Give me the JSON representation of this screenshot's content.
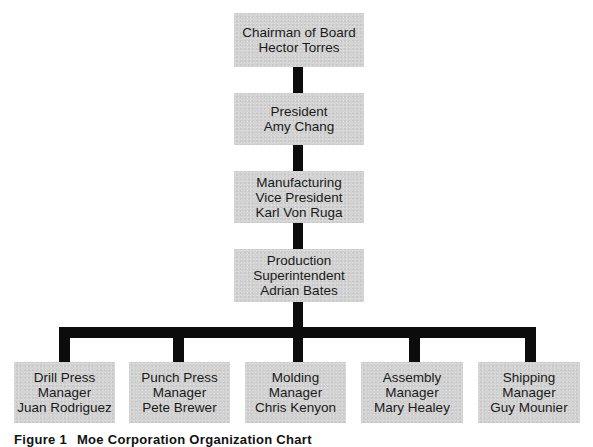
{
  "chart": {
    "title": "Organization Chart",
    "levels": [
      {
        "id": "chairman",
        "lines": [
          "Chairman of Board",
          "Hector Torres"
        ]
      },
      {
        "id": "president",
        "lines": [
          "President",
          "Amy Chang"
        ]
      },
      {
        "id": "vp-manufacturing",
        "lines": [
          "Manufacturing",
          "Vice President",
          "Karl Von Ruga"
        ]
      },
      {
        "id": "production-superintendent",
        "lines": [
          "Production",
          "Superintendent",
          "Adrian Bates"
        ]
      }
    ],
    "managers": [
      {
        "id": "drill-press-manager",
        "lines": [
          "Drill Press",
          "Manager",
          "Juan Rodriguez"
        ]
      },
      {
        "id": "punch-press-manager",
        "lines": [
          "Punch Press",
          "Manager",
          "Pete Brewer"
        ]
      },
      {
        "id": "molding-manager",
        "lines": [
          "Molding",
          "Manager",
          "Chris Kenyon"
        ]
      },
      {
        "id": "assembly-manager",
        "lines": [
          "Assembly",
          "Manager",
          "Mary Healey"
        ]
      },
      {
        "id": "shipping-manager",
        "lines": [
          "Shipping",
          "Manager",
          "Guy Mounier"
        ]
      }
    ]
  },
  "caption": {
    "figure": "Figure 1",
    "text": "Moe Corporation Organization Chart"
  },
  "colors": {
    "box_fill": "#d3d3d3",
    "connector": "#0c0c0c",
    "text": "#1a1a1a",
    "background": "#ffffff"
  }
}
